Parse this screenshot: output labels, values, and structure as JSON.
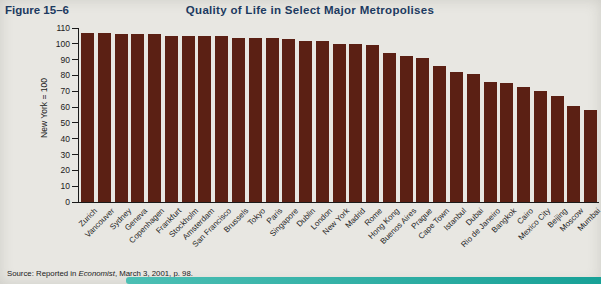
{
  "figure_label": "Figure 15–6",
  "title": "Quality of Life in Select Major Metropolises",
  "source": {
    "prefix": "Source: Reported in ",
    "publication": "Economist",
    "suffix": ", March 3, 2001, p. 98."
  },
  "colors": {
    "bar": "#5b2014",
    "heading_navy": "#1c3a60",
    "background": "#e8e7e2",
    "accent_teal": "#2fb0a6"
  },
  "chart_data": {
    "type": "bar",
    "title": "Quality of Life in Select Major Metropolises",
    "xlabel": "",
    "ylabel": "New York = 100",
    "ylim": [
      0,
      110
    ],
    "ytick_step": 10,
    "grid": false,
    "legend": false,
    "categories": [
      "Zurich",
      "Vancouver",
      "Sydney",
      "Geneva",
      "Copenhagen",
      "Frankfurt",
      "Stockholm",
      "Amsterdam",
      "San Francisco",
      "Brussels",
      "Tokyo",
      "Paris",
      "Singapore",
      "Dublin",
      "London",
      "New York",
      "Madrid",
      "Rome",
      "Hong Kong",
      "Buenos Aires",
      "Prague",
      "Cape Town",
      "Istanbul",
      "Dubai",
      "Rio de Janeiro",
      "Bangkok",
      "Cairo",
      "Mexico City",
      "Beijing",
      "Moscow",
      "Mumbai"
    ],
    "values": [
      107,
      107,
      106,
      106,
      106,
      105,
      105,
      105,
      105,
      104,
      104,
      104,
      103,
      102,
      102,
      100,
      100,
      99,
      94,
      92,
      91,
      86,
      82,
      81,
      76,
      75,
      73,
      70,
      67,
      61,
      58
    ]
  }
}
